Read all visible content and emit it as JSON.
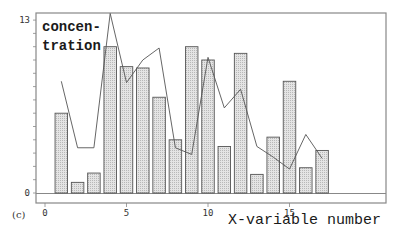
{
  "panel_label": "(c)",
  "chart_data": {
    "type": "bar",
    "title": "",
    "xlabel": "X-variable number",
    "ylabel": "concen-\ntration",
    "ylabel_lines": [
      "concen-",
      "tration"
    ],
    "xlim": [
      0,
      21
    ],
    "ylim": [
      0,
      13
    ],
    "xticks": [
      0,
      5,
      10,
      15
    ],
    "yticks": [
      0,
      13
    ],
    "grid": false,
    "legend": null,
    "categories": [
      1,
      2,
      3,
      4,
      5,
      6,
      7,
      8,
      9,
      10,
      11,
      12,
      13,
      14,
      15,
      16,
      17
    ],
    "series": [
      {
        "name": "bars",
        "type": "bar",
        "values": [
          6.0,
          0.8,
          1.5,
          11.0,
          9.5,
          9.4,
          7.2,
          4.0,
          11.0,
          10.0,
          3.5,
          10.5,
          1.4,
          4.2,
          8.4,
          1.9,
          3.2
        ]
      },
      {
        "name": "line",
        "type": "line",
        "values": [
          8.4,
          3.4,
          3.4,
          13.5,
          8.3,
          10.0,
          10.9,
          3.4,
          2.9,
          10.2,
          6.4,
          7.8,
          3.5,
          2.7,
          1.8,
          4.4,
          2.6
        ]
      }
    ],
    "colors": {
      "bar_fill": "#d6d6d6",
      "bar_stroke": "#555555",
      "line": "#555555",
      "frame": "#888888"
    }
  }
}
